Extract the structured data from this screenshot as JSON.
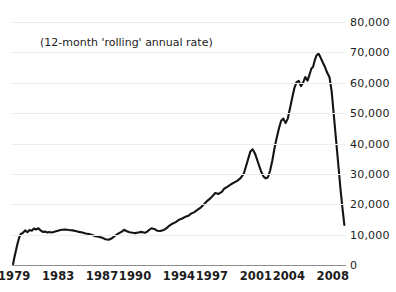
{
  "ghost_title": "",
  "annotation": {
    "text": "(12-month 'rolling' annual rate)",
    "x": 40,
    "y": 36
  },
  "axis": {
    "y_labels": [
      "80,000",
      "70,000",
      "60,000",
      "50,000",
      "40,000",
      "30,000",
      "20,000",
      "10,000",
      "0"
    ],
    "x_labels": [
      "1979",
      "1983",
      "1987",
      "1990",
      "1994",
      "1997",
      "2001",
      "2004",
      "2008"
    ]
  },
  "colors": {
    "line": "#141414",
    "grid": "#ececec",
    "axis": "#8d8d8d",
    "text": "#1c1c1c",
    "background": "#ffffff"
  },
  "chart_data": {
    "type": "line",
    "title": "",
    "subtitle": "(12-month 'rolling' annual rate)",
    "xlabel": "",
    "ylabel": "",
    "xlim": [
      1978.8,
      2009.2
    ],
    "ylim": [
      0,
      80000
    ],
    "grid": true,
    "legend": null,
    "ytick_values": [
      80000,
      70000,
      60000,
      50000,
      40000,
      30000,
      20000,
      10000,
      0
    ],
    "ytick_labels": [
      "80,000",
      "70,000",
      "60,000",
      "50,000",
      "40,000",
      "30,000",
      "20,000",
      "10,000",
      "0"
    ],
    "xtick_values": [
      1979,
      1983,
      1987,
      1990,
      1994,
      1997,
      2001,
      2004,
      2008
    ],
    "xtick_labels": [
      "1979",
      "1983",
      "1987",
      "1990",
      "1994",
      "1997",
      "2001",
      "2004",
      "2008"
    ],
    "series": [
      {
        "name": "rolling annual rate",
        "color": "#141414",
        "x": [
          1978.9,
          1979.0,
          1979.15,
          1979.3,
          1979.45,
          1979.6,
          1979.8,
          1980.0,
          1980.2,
          1980.4,
          1980.6,
          1980.8,
          1981.0,
          1981.2,
          1981.4,
          1981.6,
          1981.8,
          1982.0,
          1982.2,
          1982.4,
          1982.6,
          1982.8,
          1983.0,
          1983.2,
          1983.4,
          1983.6,
          1983.8,
          1984.0,
          1984.3,
          1984.6,
          1984.9,
          1985.2,
          1985.5,
          1985.8,
          1986.1,
          1986.4,
          1986.7,
          1987.0,
          1987.3,
          1987.6,
          1987.9,
          1988.2,
          1988.5,
          1988.8,
          1989.0,
          1989.2,
          1989.5,
          1989.8,
          1990.0,
          1990.3,
          1990.6,
          1990.9,
          1991.1,
          1991.3,
          1991.5,
          1991.8,
          1992.0,
          1992.3,
          1992.6,
          1992.9,
          1993.1,
          1993.4,
          1993.7,
          1994.0,
          1994.3,
          1994.6,
          1994.9,
          1995.1,
          1995.4,
          1995.7,
          1996.0,
          1996.3,
          1996.6,
          1996.9,
          1997.1,
          1997.3,
          1997.6,
          1997.9,
          1998.1,
          1998.4,
          1998.7,
          1999.0,
          1999.3,
          1999.6,
          1999.9,
          2000.1,
          2000.3,
          2000.5,
          2000.7,
          2000.9,
          2001.1,
          2001.3,
          2001.5,
          2001.7,
          2001.9,
          2002.1,
          2002.3,
          2002.5,
          2002.7,
          2002.9,
          2003.1,
          2003.3,
          2003.5,
          2003.7,
          2003.9,
          2004.1,
          2004.3,
          2004.5,
          2004.7,
          2004.9,
          2005.1,
          2005.3,
          2005.5,
          2005.7,
          2005.9,
          2006.05,
          2006.2,
          2006.35,
          2006.5,
          2006.7,
          2006.9,
          2007.1,
          2007.3,
          2007.5,
          2007.7,
          2007.9,
          2008.1,
          2008.3,
          2008.5,
          2008.7,
          2008.9,
          2009.05
        ],
        "y": [
          300,
          2200,
          4600,
          7000,
          9000,
          10200,
          10600,
          11400,
          10800,
          11500,
          11300,
          12000,
          11700,
          12100,
          11400,
          10900,
          11000,
          10700,
          10900,
          10700,
          10900,
          11100,
          11300,
          11500,
          11600,
          11700,
          11600,
          11500,
          11400,
          11200,
          10900,
          10700,
          10400,
          10200,
          9900,
          9500,
          9300,
          9000,
          8500,
          8300,
          8800,
          9700,
          10400,
          11000,
          11600,
          11200,
          10800,
          10600,
          10500,
          10700,
          10900,
          10600,
          11000,
          11600,
          12100,
          11800,
          11300,
          11200,
          11500,
          12200,
          12900,
          13600,
          14100,
          14900,
          15300,
          15900,
          16300,
          16900,
          17400,
          18200,
          19000,
          20100,
          21200,
          22100,
          22900,
          23700,
          23400,
          24100,
          25100,
          25700,
          26500,
          27100,
          27700,
          28600,
          30100,
          32500,
          35000,
          37400,
          38100,
          36800,
          34800,
          32600,
          30600,
          29100,
          28500,
          28900,
          31200,
          34500,
          38600,
          42000,
          45000,
          47500,
          48200,
          46700,
          48200,
          51500,
          55000,
          58200,
          60200,
          60600,
          58900,
          60100,
          61900,
          60700,
          62900,
          64700,
          65200,
          67300,
          68900,
          69600,
          68200,
          66600,
          65100,
          63200,
          61800,
          57000,
          49000,
          41000,
          33000,
          25000,
          18000,
          13200
        ]
      }
    ]
  }
}
